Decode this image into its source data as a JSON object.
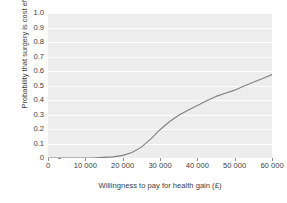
{
  "chart_data": {
    "type": "line",
    "title": "",
    "xlabel": "Willingness to pay for health gain (£)",
    "ylabel": "Probability that surgery is cost effective",
    "xlim": [
      0,
      60000
    ],
    "ylim": [
      0,
      1.0
    ],
    "grid": "horizontal",
    "legend": "none",
    "line_color": "#808080",
    "plot_background": "#ededed",
    "gridline_color": "#ffffff",
    "x_tick_labels": [
      "0",
      "10 000",
      "20 000",
      "30 000",
      "40 000",
      "50 000",
      "60 000"
    ],
    "x_tick_values": [
      0,
      10000,
      20000,
      30000,
      40000,
      50000,
      60000
    ],
    "y_tick_labels": [
      "0",
      "0.1",
      "0.2",
      "0.3",
      "0.4",
      "0.5",
      "0.6",
      "0.7",
      "0.8",
      "0.9",
      "1.0"
    ],
    "y_tick_values": [
      0,
      0.1,
      0.2,
      0.3,
      0.4,
      0.5,
      0.6,
      0.7,
      0.8,
      0.9,
      1.0
    ],
    "series": [
      {
        "name": "Probability surgery is cost effective",
        "x": [
          0,
          2500,
          5000,
          7500,
          10000,
          12500,
          15000,
          17500,
          20000,
          22500,
          25000,
          27500,
          30000,
          32500,
          35000,
          37500,
          40000,
          42500,
          45000,
          47500,
          50000,
          52500,
          55000,
          57500,
          60000
        ],
        "y": [
          0.0,
          0.0,
          0.0,
          0.0,
          0.0,
          0.001,
          0.004,
          0.008,
          0.018,
          0.038,
          0.075,
          0.13,
          0.195,
          0.25,
          0.295,
          0.33,
          0.362,
          0.395,
          0.425,
          0.447,
          0.468,
          0.497,
          0.522,
          0.548,
          0.575
        ]
      }
    ]
  }
}
